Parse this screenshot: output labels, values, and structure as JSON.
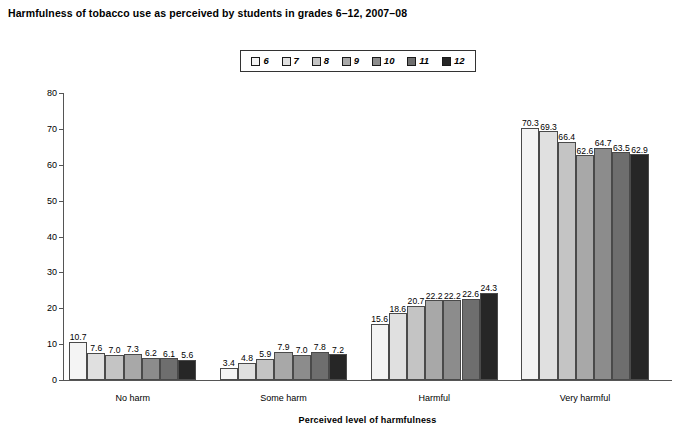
{
  "chart_data": {
    "type": "bar",
    "title": "Harmfulness of tobacco use as perceived by students in grades 6–12, 2007–08",
    "xlabel": "Perceived level of harmfulness",
    "ylabel": "Percentage of students",
    "ylim": [
      0,
      80
    ],
    "ytick_labels": [
      "0",
      "10",
      "20",
      "30",
      "40",
      "50",
      "60",
      "70",
      "80"
    ],
    "yticks": [
      0,
      10,
      20,
      30,
      40,
      50,
      60,
      70,
      80
    ],
    "grid": false,
    "legend_position": "top-center",
    "legend_title": "",
    "categories": [
      "No harm",
      "Some harm",
      "Harmful",
      "Very harmful"
    ],
    "series": [
      {
        "name": "6",
        "color": "#f4f4f4",
        "values": [
          10.7,
          3.4,
          15.6,
          70.3
        ]
      },
      {
        "name": "7",
        "color": "#e0e0e0",
        "values": [
          7.6,
          4.8,
          18.6,
          69.3
        ]
      },
      {
        "name": "8",
        "color": "#c4c4c4",
        "values": [
          7.0,
          5.9,
          20.7,
          66.4
        ]
      },
      {
        "name": "9",
        "color": "#a8a8a8",
        "values": [
          7.3,
          7.9,
          22.2,
          62.6
        ]
      },
      {
        "name": "10",
        "color": "#8c8c8c",
        "values": [
          6.2,
          7.0,
          22.2,
          64.7
        ]
      },
      {
        "name": "11",
        "color": "#6e6e6e",
        "values": [
          6.1,
          7.8,
          22.6,
          63.5
        ]
      },
      {
        "name": "12",
        "color": "#262626",
        "values": [
          5.6,
          7.2,
          24.3,
          62.9
        ]
      }
    ]
  }
}
